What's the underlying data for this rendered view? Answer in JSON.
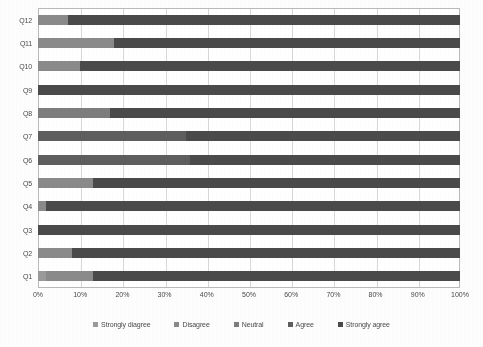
{
  "chart_data": {
    "type": "bar",
    "orientation": "horizontal",
    "stacked": true,
    "normalized_percent": true,
    "title": "",
    "xlabel": "",
    "ylabel": "",
    "xlim": [
      0,
      100
    ],
    "grid": true,
    "legend_position": "bottom",
    "categories": [
      "Q1",
      "Q2",
      "Q3",
      "Q4",
      "Q5",
      "Q6",
      "Q7",
      "Q8",
      "Q9",
      "Q10",
      "Q11",
      "Q12"
    ],
    "category_order_top_to_bottom": [
      "Q12",
      "Q11",
      "Q10",
      "Q9",
      "Q8",
      "Q7",
      "Q6",
      "Q5",
      "Q4",
      "Q3",
      "Q2",
      "Q1"
    ],
    "xtick_labels": [
      "0%",
      "10%",
      "20%",
      "30%",
      "40%",
      "50%",
      "60%",
      "70%",
      "80%",
      "90%",
      "100%"
    ],
    "xtick_values": [
      0,
      10,
      20,
      30,
      40,
      50,
      60,
      70,
      80,
      90,
      100
    ],
    "series": [
      {
        "name": "Strongly diagree",
        "color": "#9a9a9a",
        "values": [
          2,
          0,
          0,
          0,
          0,
          0,
          0,
          0,
          0,
          0,
          0,
          0
        ]
      },
      {
        "name": "Disagree",
        "color": "#8a8a8a",
        "values": [
          11,
          8,
          0,
          2,
          13,
          0,
          0,
          0,
          0,
          10,
          18,
          7
        ]
      },
      {
        "name": "Neutral",
        "color": "#7d7d7d",
        "values": [
          0,
          0,
          0,
          0,
          0,
          0,
          0,
          17,
          0,
          0,
          0,
          0
        ]
      },
      {
        "name": "Agree",
        "color": "#5e5e5e",
        "values": [
          0,
          0,
          0,
          0,
          0,
          36,
          35,
          0,
          0,
          0,
          0,
          0
        ]
      },
      {
        "name": "Strongly agree",
        "color": "#4a4a4a",
        "values": [
          87,
          92,
          100,
          98,
          87,
          64,
          65,
          83,
          100,
          90,
          82,
          93
        ]
      }
    ],
    "legend_entries": [
      {
        "label": "Strongly diagree",
        "color": "#9a9a9a"
      },
      {
        "label": "Disagree",
        "color": "#8a8a8a"
      },
      {
        "label": "Neutral",
        "color": "#7d7d7d"
      },
      {
        "label": "Agree",
        "color": "#5e5e5e"
      },
      {
        "label": "Strongly agree",
        "color": "#4a4a4a"
      }
    ],
    "bars_top_to_bottom": [
      {
        "category": "Q12",
        "segments": [
          {
            "series": "Disagree",
            "value": 7,
            "color": "#8a8a8a"
          },
          {
            "series": "Strongly agree",
            "value": 93,
            "color": "#4a4a4a"
          }
        ]
      },
      {
        "category": "Q11",
        "segments": [
          {
            "series": "Disagree",
            "value": 18,
            "color": "#8a8a8a"
          },
          {
            "series": "Strongly agree",
            "value": 82,
            "color": "#4a4a4a"
          }
        ]
      },
      {
        "category": "Q10",
        "segments": [
          {
            "series": "Disagree",
            "value": 10,
            "color": "#8a8a8a"
          },
          {
            "series": "Strongly agree",
            "value": 90,
            "color": "#4a4a4a"
          }
        ]
      },
      {
        "category": "Q9",
        "segments": [
          {
            "series": "Strongly agree",
            "value": 100,
            "color": "#4a4a4a"
          }
        ]
      },
      {
        "category": "Q8",
        "segments": [
          {
            "series": "Neutral",
            "value": 17,
            "color": "#7d7d7d"
          },
          {
            "series": "Strongly agree",
            "value": 83,
            "color": "#4a4a4a"
          }
        ]
      },
      {
        "category": "Q7",
        "segments": [
          {
            "series": "Agree",
            "value": 35,
            "color": "#5e5e5e"
          },
          {
            "series": "Strongly agree",
            "value": 65,
            "color": "#4a4a4a"
          }
        ]
      },
      {
        "category": "Q6",
        "segments": [
          {
            "series": "Agree",
            "value": 36,
            "color": "#5e5e5e"
          },
          {
            "series": "Strongly agree",
            "value": 64,
            "color": "#4a4a4a"
          }
        ]
      },
      {
        "category": "Q5",
        "segments": [
          {
            "series": "Disagree",
            "value": 13,
            "color": "#8a8a8a"
          },
          {
            "series": "Strongly agree",
            "value": 87,
            "color": "#4a4a4a"
          }
        ]
      },
      {
        "category": "Q4",
        "segments": [
          {
            "series": "Disagree",
            "value": 2,
            "color": "#8a8a8a"
          },
          {
            "series": "Strongly agree",
            "value": 98,
            "color": "#4a4a4a"
          }
        ]
      },
      {
        "category": "Q3",
        "segments": [
          {
            "series": "Strongly agree",
            "value": 100,
            "color": "#4a4a4a"
          }
        ]
      },
      {
        "category": "Q2",
        "segments": [
          {
            "series": "Disagree",
            "value": 8,
            "color": "#8a8a8a"
          },
          {
            "series": "Strongly agree",
            "value": 92,
            "color": "#4a4a4a"
          }
        ]
      },
      {
        "category": "Q1",
        "segments": [
          {
            "series": "Strongly diagree",
            "value": 2,
            "color": "#9a9a9a"
          },
          {
            "series": "Disagree",
            "value": 11,
            "color": "#8a8a8a"
          },
          {
            "series": "Strongly agree",
            "value": 87,
            "color": "#4a4a4a"
          }
        ]
      }
    ]
  }
}
